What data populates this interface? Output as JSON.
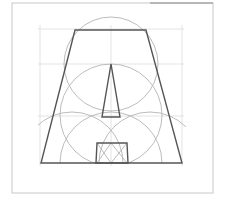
{
  "diagram": {
    "title": "Geometric construction: trapezoid with inscribed triangle and square",
    "colors": {
      "background": "#ffffff",
      "frame": "#c8c8c8",
      "frame_top_accent": "#8a8a8a",
      "guide": "#dcdcdc",
      "arc": "#b4b4b4",
      "shape": "#555555"
    },
    "frame": {
      "x": 12,
      "y": 3,
      "width": 201,
      "height": 190
    },
    "guides": {
      "horizontal_y": [
        29,
        64,
        116
      ],
      "vertical_x": [
        40,
        111,
        182
      ],
      "x_extent": [
        38,
        184
      ],
      "y_extent": [
        25,
        166
      ]
    },
    "circles": [
      {
        "name": "top-circle",
        "cx": 111,
        "cy": 64,
        "r": 47
      },
      {
        "name": "middle-circle",
        "cx": 111,
        "cy": 115,
        "r": 51
      },
      {
        "name": "bottom-left-arc-circle",
        "cx": 72,
        "cy": 163,
        "r": 51
      },
      {
        "name": "bottom-right-arc-circle",
        "cx": 150,
        "cy": 163,
        "r": 51
      },
      {
        "name": "bottom-center-circle",
        "cx": 111,
        "cy": 163,
        "r": 51
      }
    ],
    "trapezoid": {
      "points": [
        [
          75,
          30
        ],
        [
          146,
          30
        ],
        [
          182,
          163
        ],
        [
          41,
          163
        ]
      ]
    },
    "triangle": {
      "points": [
        [
          111,
          64
        ],
        [
          120,
          117
        ],
        [
          102,
          117
        ]
      ]
    },
    "square": {
      "points": [
        [
          97,
          143
        ],
        [
          127,
          143
        ],
        [
          128,
          163
        ],
        [
          96,
          163
        ]
      ]
    },
    "square_diagonals": [
      [
        [
          97,
          143
        ],
        [
          111,
          163
        ]
      ],
      [
        [
          127,
          143
        ],
        [
          111,
          163
        ]
      ],
      [
        [
          97,
          163
        ],
        [
          111,
          143
        ]
      ],
      [
        [
          127,
          163
        ],
        [
          111,
          143
        ]
      ]
    ]
  }
}
